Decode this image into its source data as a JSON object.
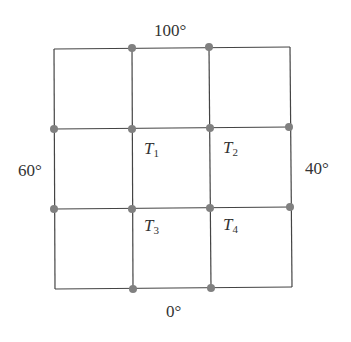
{
  "diagram": {
    "boundary": {
      "top": "100°",
      "left": "60°",
      "right": "40°",
      "bottom": "0°"
    },
    "interior_nodes": [
      {
        "symbol": "T",
        "sub": "1"
      },
      {
        "symbol": "T",
        "sub": "2"
      },
      {
        "symbol": "T",
        "sub": "3"
      },
      {
        "symbol": "T",
        "sub": "4"
      }
    ],
    "grid": {
      "rows": 3,
      "cols": 3
    },
    "colors": {
      "line": "#444444",
      "node": "#808080"
    }
  }
}
